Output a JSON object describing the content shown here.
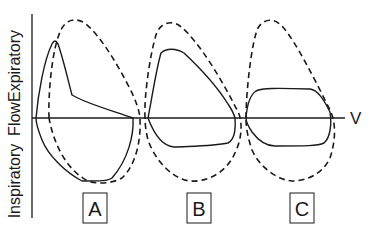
{
  "diagram": {
    "type": "flow-volume loops",
    "y_axis": {
      "label_top": "Expiratory",
      "label_middle": "Flow",
      "label_bottom": "Inspiratory"
    },
    "x_axis": {
      "label": "V"
    },
    "panels": [
      {
        "id": "A",
        "label": "A",
        "description": "Solid loop with early sharp expiratory peak then concave decline; dashed reference loop"
      },
      {
        "id": "B",
        "label": "B",
        "description": "Solid loop with flattened expiratory plateau and flattened inspiratory limb; dashed reference loop"
      },
      {
        "id": "C",
        "label": "C",
        "description": "Solid loop flattened on both expiratory and inspiratory limbs; dashed reference loop"
      }
    ],
    "legend": {
      "solid_line": "observed loop",
      "dashed_line": "normal loop"
    },
    "colors": {
      "line": "#1a1a1a",
      "background": "#ffffff"
    }
  }
}
